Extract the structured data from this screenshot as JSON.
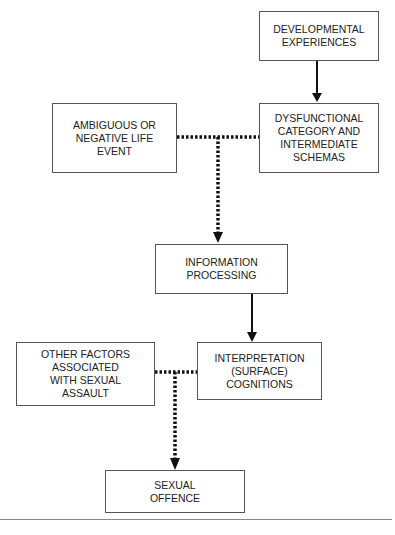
{
  "diagram": {
    "type": "flowchart",
    "nodes": [
      {
        "id": "developmental",
        "label": "DEVELOPMENTAL\nEXPERIENCES"
      },
      {
        "id": "dysfunctional",
        "label": "DYSFUNCTIONAL\nCATEGORY AND\nINTERMEDIATE\nSCHEMAS"
      },
      {
        "id": "ambiguous",
        "label": "AMBIGUOUS OR\nNEGATIVE LIFE\nEVENT"
      },
      {
        "id": "information",
        "label": "INFORMATION\nPROCESSING"
      },
      {
        "id": "other_factors",
        "label": "OTHER FACTORS\nASSOCIATED\nWITH SEXUAL\nASSAULT"
      },
      {
        "id": "interpretation",
        "label": "INTERPRETATION\n(SURFACE)\nCOGNITIONS"
      },
      {
        "id": "offence",
        "label": "SEXUAL\nOFFENCE"
      }
    ],
    "edges": [
      {
        "from": "developmental",
        "to": "dysfunctional",
        "style": "solid"
      },
      {
        "from": [
          "ambiguous",
          "dysfunctional"
        ],
        "to": "information",
        "style": "dotted"
      },
      {
        "from": "information",
        "to": "interpretation",
        "style": "solid"
      },
      {
        "from": [
          "other_factors",
          "interpretation"
        ],
        "to": "offence",
        "style": "dotted"
      }
    ],
    "colors": {
      "line": "#111111",
      "border": "#555555",
      "text": "#222222"
    }
  }
}
